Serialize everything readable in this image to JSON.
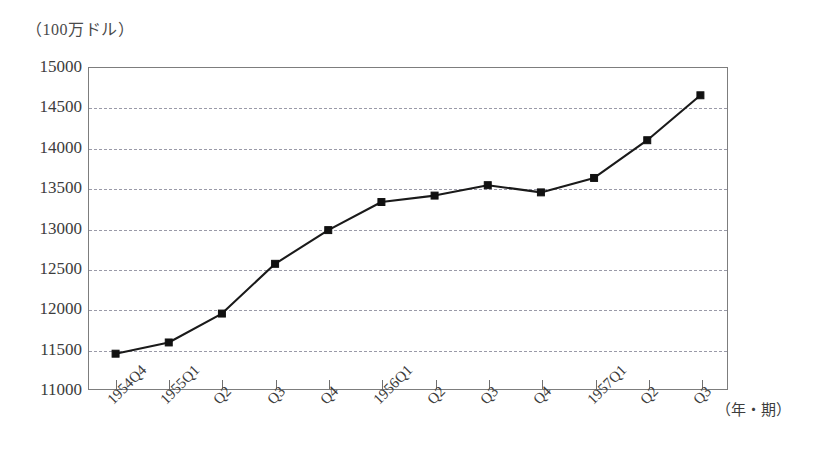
{
  "chart_data": {
    "type": "line",
    "title": "",
    "subtitle": "",
    "ylabel": "（100万ドル）",
    "xlabel": "（年・期）",
    "categories": [
      "1954Q4",
      "1955Q1",
      "Q2",
      "Q3",
      "Q4",
      "1956Q1",
      "Q2",
      "Q3",
      "Q4",
      "1957Q1",
      "Q2",
      "Q3"
    ],
    "values": [
      11440,
      11580,
      11940,
      12560,
      12980,
      13330,
      13410,
      13540,
      13450,
      13630,
      14100,
      14660
    ],
    "series": [
      {
        "name": "",
        "values": [
          11440,
          11580,
          11940,
          12560,
          12980,
          13330,
          13410,
          13540,
          13450,
          13630,
          14100,
          14660
        ]
      }
    ],
    "ylim": [
      11000,
      15000
    ],
    "yticks": [
      15000,
      14500,
      14000,
      13500,
      13000,
      12500,
      12000,
      11500,
      11000
    ],
    "ytick_labels": [
      "15000",
      "14500",
      "14000",
      "13500",
      "13000",
      "12500",
      "12000",
      "11500",
      "11000"
    ],
    "grid": true,
    "grid_style": "dashed-horizontal",
    "legend": "none",
    "marker": "square",
    "line_color": "#1a1a1a",
    "marker_color": "#111111",
    "grid_color": "#9a9aa8",
    "frame_color": "#7d7d7d"
  }
}
